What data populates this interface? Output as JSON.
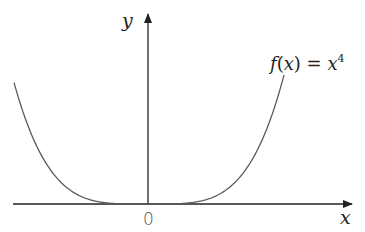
{
  "chart_data": {
    "type": "line",
    "title": "",
    "xlabel": "x",
    "ylabel": "y",
    "origin_label": "0",
    "grid": false,
    "legend": "none",
    "annotations": [
      {
        "text": "f(x) = x⁴",
        "position": "upper-right near curve end"
      }
    ],
    "series": [
      {
        "name": "f(x) = x^4",
        "function": "x^4",
        "x": [
          -1.0,
          -0.75,
          -0.5,
          -0.25,
          0,
          0.25,
          0.5,
          0.75,
          1.0
        ],
        "values": [
          1.0,
          0.3164,
          0.0625,
          0.0039,
          0,
          0.0039,
          0.0625,
          0.3164,
          1.0
        ]
      }
    ],
    "xlim": [
      -1.0,
      1.6
    ],
    "ylim": [
      0,
      1.4
    ]
  },
  "labels": {
    "y_axis": "y",
    "x_axis": "x",
    "origin": "0",
    "func_f": "f",
    "func_paren_open": "(",
    "func_x": "x",
    "func_paren_close": ")",
    "func_eq": " = ",
    "func_rhs_base": "x",
    "func_rhs_exp": "4"
  },
  "colors": {
    "axis": "#222222",
    "curve": "#5a5a5a",
    "text": "#222222"
  }
}
